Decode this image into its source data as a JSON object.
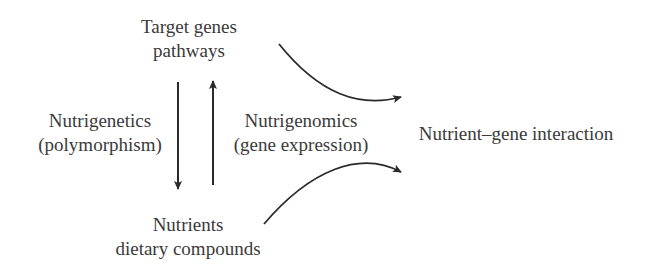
{
  "diagram": {
    "nodes": {
      "target": {
        "line1": "Target genes",
        "line2": "pathways"
      },
      "nutrients": {
        "line1": "Nutrients",
        "line2": "dietary compounds"
      },
      "interaction": {
        "line1": "Nutrient–gene interaction"
      },
      "nutrigenetics": {
        "line1": "Nutrigenetics",
        "line2": "(polymorphism)"
      },
      "nutrigenomics": {
        "line1": "Nutrigenomics",
        "line2": "(gene expression)"
      }
    },
    "edges": [
      {
        "from": "target",
        "to": "nutrients",
        "direction": "down",
        "label": "Nutrigenetics (polymorphism)"
      },
      {
        "from": "nutrients",
        "to": "target",
        "direction": "up",
        "label": "Nutrigenomics (gene expression)"
      },
      {
        "from": "target",
        "to": "interaction",
        "style": "curved"
      },
      {
        "from": "nutrients",
        "to": "interaction",
        "style": "curved"
      }
    ],
    "colors": {
      "text": "#3a3a3a",
      "arrow": "#2a2a2a"
    }
  }
}
